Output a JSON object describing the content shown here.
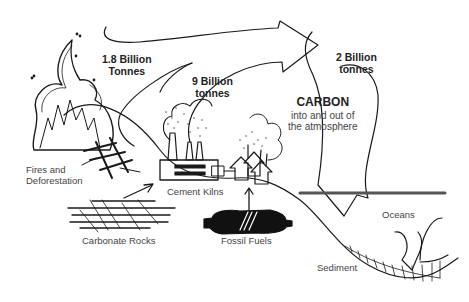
{
  "diagram": {
    "center_label": {
      "title": "CARBON",
      "subtitle_line1": "into and out of",
      "subtitle_line2": "the atmosphere"
    },
    "flows": [
      {
        "line1": "1.8 Billion",
        "line2": "Tonnes",
        "source": "Fires and Deforestation"
      },
      {
        "line1": "9 Billion",
        "line2": "tonnes",
        "source": "Cement Kilns / Fossil Fuels"
      },
      {
        "line1": "2 Billion",
        "line2": "tonnes",
        "target": "Oceans"
      }
    ],
    "sources": {
      "fires": {
        "line1": "Fires and",
        "line2": "Deforestation"
      },
      "cement": "Cement Kilns",
      "rocks": "Carbonate Rocks",
      "fossil": "Fossil Fuels",
      "oceans": "Oceans",
      "sediment": "Sediment"
    },
    "colors": {
      "ink": "#1a1a1a",
      "text": "#333333",
      "background": "#ffffff",
      "ocean_line": "#555555"
    }
  }
}
